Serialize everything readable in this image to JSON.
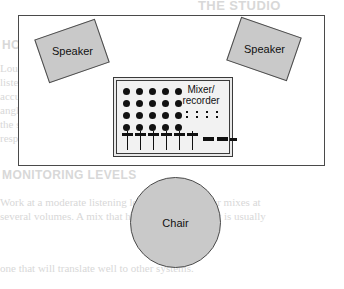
{
  "diagram": {
    "room": {
      "name": "room-boundary"
    },
    "speakers": [
      {
        "label": "Speaker",
        "position": "left",
        "rotation_deg": -19
      },
      {
        "label": "Speaker",
        "position": "right",
        "rotation_deg": 19
      }
    ],
    "mixer": {
      "label_line1": "Mixer/",
      "label_line2": "recorder",
      "knob_rows": 4,
      "knob_cols": 5,
      "knob_count": 20,
      "led_rows": 2,
      "led_cols": 4,
      "fader_count": 6,
      "bar_count": 3
    },
    "chair": {
      "label": "Chair"
    },
    "colors": {
      "fill_gray": "#c9c9c9",
      "panel_gray": "#f2f2f2",
      "outline": "#4a4a4a",
      "ink": "#111111",
      "background": "#ffffff"
    }
  },
  "background_bleed": {
    "lines": [
      "THE STUDIO",
      "HOW STEREO WORKS",
      "Loudspeakers should form an equilateral triangle with the",
      "listening position so that the stereo image is balanced and",
      "accurate. Sit at the apex of the triangle, with each speaker",
      "angled inward toward the centre of your head. Avoid placing",
      "the speakers hard against a wall, as this exaggerates the bass",
      "response and blurs the stereo picture. Keep the tweeters at",
      "roughly ear height when seated.",
      "MONITORING LEVELS",
      "Work at a moderate listening level and check your mixes at",
      "several volumes. A mix that holds together quietly is usually",
      "one that will translate well to other systems."
    ]
  }
}
